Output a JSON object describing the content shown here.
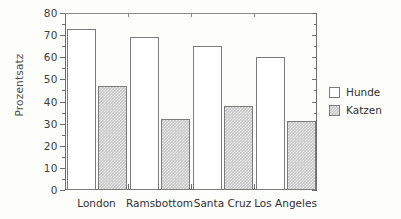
{
  "chart_data": {
    "type": "bar",
    "title": "",
    "subtitle": "",
    "xlabel": "",
    "ylabel": "Prozentsatz",
    "categories": [
      "London",
      "Ramsbottom",
      "Santa Cruz",
      "Los Angeles"
    ],
    "series": [
      {
        "name": "Hunde",
        "values": [
          73,
          69,
          65,
          60
        ],
        "fill": "white",
        "color": "#ffffff"
      },
      {
        "name": "Katzen",
        "values": [
          47,
          32,
          38,
          31
        ],
        "fill": "hatched",
        "color": "#c9c9c9"
      }
    ],
    "ylim": [
      0,
      80
    ],
    "yticks": [
      0,
      10,
      20,
      30,
      40,
      50,
      60,
      70,
      80
    ],
    "ytick_labels": [
      "0",
      "10",
      "20",
      "30",
      "40",
      "50",
      "60",
      "70",
      "80"
    ],
    "y_minor_tick_interval": 5,
    "grid": false,
    "legend_position": "right",
    "legend_entries": [
      "Hunde",
      "Katzen"
    ],
    "axis_color": "#6e6e6e",
    "background_color": "#fdfdfc"
  }
}
